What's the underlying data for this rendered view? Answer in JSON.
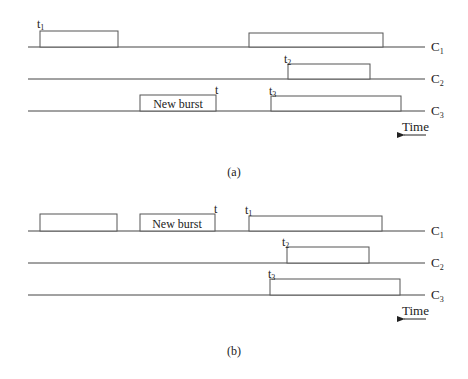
{
  "panels": [
    {
      "caption": "(a)",
      "channels": [
        "C",
        "C",
        "C"
      ],
      "channel_subs": [
        "1",
        "2",
        "3"
      ],
      "new_burst_label": "New burst",
      "t_label": "t",
      "t1": {
        "main": "t",
        "sub": "1"
      },
      "t2": {
        "main": "t",
        "sub": "2"
      },
      "t3": {
        "main": "t",
        "sub": "3"
      },
      "time_label": "Time"
    },
    {
      "caption": "(b)",
      "channels": [
        "C",
        "C",
        "C"
      ],
      "channel_subs": [
        "1",
        "2",
        "3"
      ],
      "new_burst_label": "New burst",
      "t_label": "t",
      "t1": {
        "main": "t",
        "sub": "1"
      },
      "t2": {
        "main": "t",
        "sub": "2"
      },
      "t3": {
        "main": "t",
        "sub": "3"
      },
      "time_label": "Time"
    }
  ]
}
